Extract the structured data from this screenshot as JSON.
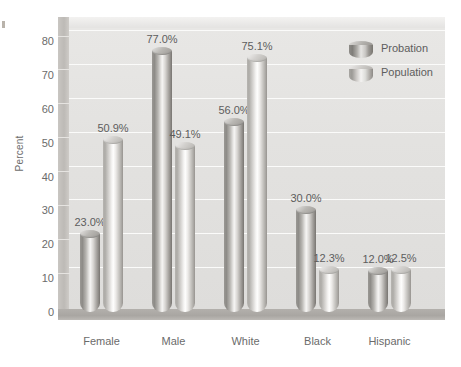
{
  "chart_data": {
    "type": "bar",
    "title": "",
    "subtitle": "",
    "xlabel": "",
    "ylabel": "Percent",
    "ylim": [
      0,
      80
    ],
    "ytick_labels": [
      "80",
      "70",
      "60",
      "50",
      "40",
      "30",
      "20",
      "10",
      "0"
    ],
    "ytick_values": [
      80,
      70,
      60,
      50,
      40,
      30,
      20,
      10,
      0
    ],
    "grid": true,
    "legend_position": "top-right",
    "categories": [
      "Female",
      "Male",
      "White",
      "Black",
      "Hispanic"
    ],
    "series": [
      {
        "name": "Probation",
        "values": [
          23.0,
          77.0,
          56.0,
          30.0,
          12.0
        ],
        "labels": [
          "23.0%",
          "77.0%",
          "56.0%",
          "30.0%",
          "12.0%"
        ],
        "color": "#8d8b87"
      },
      {
        "name": "Population",
        "values": [
          50.9,
          49.1,
          75.1,
          12.3,
          12.5
        ],
        "labels": [
          "50.9%",
          "49.1%",
          "75.1%",
          "12.3%",
          "12.5%"
        ],
        "color": "#cdcbc8"
      }
    ]
  },
  "legend": {
    "items": [
      {
        "label": "Probation"
      },
      {
        "label": "Population"
      }
    ]
  },
  "axes": {
    "y_title": "Percent"
  }
}
